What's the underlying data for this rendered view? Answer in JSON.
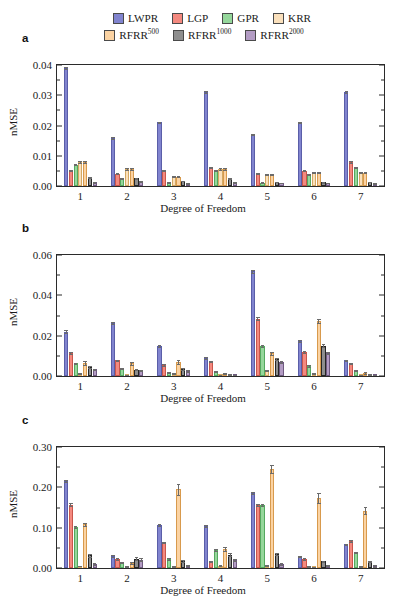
{
  "figure": {
    "panels": [
      "a",
      "b",
      "c"
    ],
    "xlabel": "Degree of Freedom",
    "ylabel": "nMSE",
    "xticks": [
      "1",
      "2",
      "3",
      "4",
      "5",
      "6",
      "7"
    ]
  },
  "legend": {
    "position": "top-center",
    "rows": [
      [
        {
          "label": "LWPR",
          "sup": "",
          "color": "#8184cf"
        },
        {
          "label": "LGP",
          "sup": "",
          "color": "#f4897f"
        },
        {
          "label": "GPR",
          "sup": "",
          "color": "#95d79b"
        },
        {
          "label": "KRR",
          "sup": "",
          "color": "#fae0bc"
        }
      ],
      [
        {
          "label": "RFRR",
          "sup": "500",
          "color": "#fbd3a3"
        },
        {
          "label": "RFRR",
          "sup": "1000",
          "color": "#8e8e8e"
        },
        {
          "label": "RFRR",
          "sup": "2000",
          "color": "#b39cc4"
        }
      ]
    ]
  },
  "chart_data": [
    {
      "type": "bar",
      "panel": "a",
      "title": "",
      "xlabel": "Degree of Freedom",
      "ylabel": "nMSE",
      "categories": [
        "1",
        "2",
        "3",
        "4",
        "5",
        "6",
        "7"
      ],
      "ylim": [
        0.0,
        0.04
      ],
      "yticks": [
        0.0,
        0.01,
        0.02,
        0.03,
        0.04
      ],
      "ytick_labels": [
        "0.00",
        "0.01",
        "0.02",
        "0.03",
        "0.04"
      ],
      "grid": false,
      "series": [
        {
          "name": "LWPR",
          "values": [
            0.039,
            0.016,
            0.021,
            0.031,
            0.017,
            0.021,
            0.031
          ],
          "errors": [
            0.0004,
            0.0003,
            0.0003,
            0.0004,
            0.0003,
            0.0003,
            0.0004
          ]
        },
        {
          "name": "LGP",
          "values": [
            0.0051,
            0.0041,
            0.0051,
            0.0061,
            0.0041,
            0.005,
            0.0079
          ],
          "errors": [
            0.0002,
            0.0002,
            0.0002,
            0.0002,
            0.0002,
            0.0002,
            0.0003
          ]
        },
        {
          "name": "GPR",
          "values": [
            0.0071,
            0.0024,
            0.0011,
            0.005,
            0.0011,
            0.0039,
            0.006
          ],
          "errors": [
            0.0002,
            0.0001,
            0.0001,
            0.0002,
            0.0001,
            0.0002,
            0.0002
          ]
        },
        {
          "name": "KRR",
          "values": [
            0.008,
            0.0055,
            0.0031,
            0.0057,
            0.0037,
            0.0044,
            0.0044
          ],
          "errors": [
            0.0003,
            0.0003,
            0.0002,
            0.0003,
            0.0002,
            0.0002,
            0.0002
          ]
        },
        {
          "name": "RFRR500",
          "values": [
            0.008,
            0.0055,
            0.0031,
            0.0057,
            0.0037,
            0.0044,
            0.0044
          ],
          "errors": [
            0.0003,
            0.0003,
            0.0002,
            0.0003,
            0.0002,
            0.0002,
            0.0002
          ]
        },
        {
          "name": "RFRR1000",
          "values": [
            0.0029,
            0.0026,
            0.0017,
            0.0024,
            0.0013,
            0.0012,
            0.0013
          ],
          "errors": [
            0.0002,
            0.0002,
            0.0001,
            0.0002,
            0.0001,
            0.0001,
            0.0001
          ]
        },
        {
          "name": "RFRR2000",
          "values": [
            0.0012,
            0.0014,
            0.0009,
            0.0012,
            0.001,
            0.001,
            0.0008
          ],
          "errors": [
            0.0001,
            0.0001,
            0.0001,
            0.0001,
            0.0001,
            0.0001,
            0.0001
          ]
        }
      ]
    },
    {
      "type": "bar",
      "panel": "b",
      "title": "",
      "xlabel": "Degree of Freedom",
      "ylabel": "nMSE",
      "categories": [
        "1",
        "2",
        "3",
        "4",
        "5",
        "6",
        "7"
      ],
      "ylim": [
        0.0,
        0.06
      ],
      "yticks": [
        0.0,
        0.02,
        0.04,
        0.06
      ],
      "ytick_labels": [
        "0.00",
        "0.02",
        "0.04",
        "0.06"
      ],
      "grid": false,
      "series": [
        {
          "name": "LWPR",
          "values": [
            0.022,
            0.0262,
            0.015,
            0.009,
            0.052,
            0.0173,
            0.0077
          ],
          "errors": [
            0.0006,
            0.0006,
            0.0005,
            0.0004,
            0.0008,
            0.0005,
            0.0003
          ]
        },
        {
          "name": "LGP",
          "values": [
            0.0113,
            0.0077,
            0.0055,
            0.0072,
            0.0284,
            0.0118,
            0.0063
          ],
          "errors": [
            0.0005,
            0.0004,
            0.0003,
            0.0004,
            0.0007,
            0.0005,
            0.0003
          ]
        },
        {
          "name": "GPR",
          "values": [
            0.0063,
            0.0036,
            0.0016,
            0.0023,
            0.0147,
            0.005,
            0.0026
          ],
          "errors": [
            0.0003,
            0.0002,
            0.0002,
            0.0002,
            0.0005,
            0.0003,
            0.0002
          ]
        },
        {
          "name": "KRR",
          "values": [
            0.0012,
            0.0005,
            0.0012,
            0.0006,
            0.0028,
            0.0012,
            0.0004
          ],
          "errors": [
            0.0002,
            0.0001,
            0.0002,
            0.0001,
            0.0003,
            0.0002,
            0.0001
          ]
        },
        {
          "name": "RFRR500",
          "values": [
            0.0064,
            0.0063,
            0.007,
            0.0011,
            0.0112,
            0.0274,
            0.0016
          ],
          "errors": [
            0.0008,
            0.0008,
            0.001,
            0.0003,
            0.0009,
            0.0011,
            0.0004
          ]
        },
        {
          "name": "RFRR1000",
          "values": [
            0.0046,
            0.0031,
            0.0035,
            0.0008,
            0.0082,
            0.0151,
            0.0007
          ],
          "errors": [
            0.0004,
            0.0003,
            0.0004,
            0.0002,
            0.0005,
            0.0007,
            0.0002
          ]
        },
        {
          "name": "RFRR2000",
          "values": [
            0.0034,
            0.0026,
            0.0025,
            0.0005,
            0.0068,
            0.0112,
            0.0005
          ],
          "errors": [
            0.0003,
            0.0003,
            0.0003,
            0.0001,
            0.0004,
            0.0005,
            0.0001
          ]
        }
      ]
    },
    {
      "type": "bar",
      "panel": "c",
      "title": "",
      "xlabel": "Degree of Freedom",
      "ylabel": "nMSE",
      "categories": [
        "1",
        "2",
        "3",
        "4",
        "5",
        "6",
        "7"
      ],
      "ylim": [
        0.0,
        0.3
      ],
      "yticks": [
        0.0,
        0.1,
        0.2,
        0.3
      ],
      "ytick_labels": [
        "0.00",
        "0.10",
        "0.20",
        "0.30"
      ],
      "grid": false,
      "series": [
        {
          "name": "LWPR",
          "values": [
            0.216,
            0.03,
            0.1075,
            0.104,
            0.186,
            0.028,
            0.0585
          ],
          "errors": [
            0.003,
            0.0015,
            0.0025,
            0.0025,
            0.003,
            0.0015,
            0.002
          ]
        },
        {
          "name": "LGP",
          "values": [
            0.157,
            0.0225,
            0.063,
            0.015,
            0.1555,
            0.0225,
            0.067
          ],
          "errors": [
            0.003,
            0.0015,
            0.0022,
            0.0012,
            0.0028,
            0.0015,
            0.0022
          ]
        },
        {
          "name": "GPR",
          "values": [
            0.1025,
            0.013,
            0.0225,
            0.045,
            0.156,
            0.003,
            0.038
          ],
          "errors": [
            0.0025,
            0.0012,
            0.0015,
            0.0018,
            0.0028,
            0.0008,
            0.0018
          ]
        },
        {
          "name": "KRR",
          "values": [
            0.005,
            0.003,
            0.0035,
            0.006,
            0.006,
            0.0025,
            0.003
          ],
          "errors": [
            0.001,
            0.0008,
            0.0008,
            0.001,
            0.001,
            0.0008,
            0.0008
          ]
        },
        {
          "name": "RFRR500",
          "values": [
            0.108,
            0.013,
            0.195,
            0.047,
            0.245,
            0.174,
            0.142
          ],
          "errors": [
            0.004,
            0.003,
            0.014,
            0.005,
            0.0095,
            0.013,
            0.0085
          ]
        },
        {
          "name": "RFRR1000",
          "values": [
            0.032,
            0.0235,
            0.0175,
            0.033,
            0.0345,
            0.0165,
            0.0165
          ],
          "errors": [
            0.0035,
            0.003,
            0.002,
            0.004,
            0.0035,
            0.002,
            0.002
          ]
        },
        {
          "name": "RFRR2000",
          "values": [
            0.01,
            0.021,
            0.0055,
            0.0195,
            0.01,
            0.0065,
            0.005
          ],
          "errors": [
            0.002,
            0.003,
            0.0015,
            0.003,
            0.002,
            0.0015,
            0.0015
          ]
        }
      ]
    }
  ],
  "colors": {
    "lwpr_fill": "#8184cf",
    "lwpr_edge": "#5a5ea8",
    "lgp_fill": "#f4897f",
    "lgp_edge": "#c9564c",
    "gpr_fill": "#95d79b",
    "gpr_edge": "#55a85f",
    "krr_fill": "#fae0bc",
    "krr_edge": "#d4a863",
    "rfrr500_fill": "#fbd3a3",
    "rfrr500_edge": "#d89a4d",
    "rfrr1000_fill": "#8e8e8e",
    "rfrr1000_edge": "#262626",
    "rfrr2000_fill": "#b39cc4",
    "rfrr2000_edge": "#6f5a80",
    "axis": "#2b2b2b",
    "error": "#6b6b6b"
  }
}
